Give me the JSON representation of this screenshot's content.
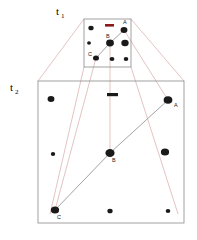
{
  "figure": {
    "background": "#ffffff",
    "frame_color": "#8a8a8a",
    "projection_color": "#d9a9a9",
    "trajectory_color": "#8c8c8c",
    "dot_color": "#1a1a1a",
    "accent_dash_color": "#8c1a1a",
    "dash_color": "#1a1a1a"
  },
  "time_labels": {
    "t1": {
      "base": "t",
      "sub": "1"
    },
    "t2": {
      "base": "t",
      "sub": "2"
    }
  },
  "frame_t1": {
    "x": 84,
    "y": 19,
    "w": 47,
    "h": 48,
    "point_labels": {
      "a": "A",
      "b": "B",
      "c": "C"
    },
    "dots": [
      {
        "cx": 91,
        "cy": 28,
        "r": 2.3
      },
      {
        "cx": 124,
        "cy": 30,
        "r": 3.0
      },
      {
        "cx": 89,
        "cy": 43,
        "r": 1.7
      },
      {
        "cx": 110,
        "cy": 43,
        "r": 3.4
      },
      {
        "cx": 125,
        "cy": 43,
        "r": 3.2
      },
      {
        "cx": 96,
        "cy": 58,
        "r": 2.6
      },
      {
        "cx": 112,
        "cy": 59,
        "r": 2.1
      },
      {
        "cx": 126,
        "cy": 59,
        "r": 2.0
      }
    ],
    "accent_dash": {
      "x": 105,
      "y": 24,
      "w": 9,
      "h": 2.6
    },
    "label_positions": {
      "a": {
        "x": 123,
        "y": 24
      },
      "b": {
        "x": 106,
        "y": 38
      },
      "c": {
        "x": 88,
        "y": 56
      }
    }
  },
  "frame_t2": {
    "x": 38,
    "y": 81,
    "w": 146,
    "h": 142,
    "point_labels": {
      "a": "A",
      "b": "B",
      "c": "C"
    },
    "dots": [
      {
        "cx": 51,
        "cy": 99,
        "r": 3.0
      },
      {
        "cx": 168,
        "cy": 100,
        "r": 3.8
      },
      {
        "cx": 53,
        "cy": 154,
        "r": 1.9
      },
      {
        "cx": 110,
        "cy": 153,
        "r": 4.0
      },
      {
        "cx": 165,
        "cy": 152,
        "r": 3.6
      },
      {
        "cx": 55,
        "cy": 210,
        "r": 3.6
      },
      {
        "cx": 110,
        "cy": 211,
        "r": 2.3
      },
      {
        "cx": 168,
        "cy": 211,
        "r": 2.0
      }
    ],
    "dash": {
      "x": 107,
      "y": 93,
      "w": 11,
      "h": 3.2
    },
    "label_positions": {
      "a": {
        "x": 174,
        "y": 107
      },
      "b": {
        "x": 112,
        "y": 162
      },
      "c": {
        "x": 57,
        "y": 219
      }
    }
  },
  "projection_lines": [
    {
      "x1": 84,
      "y1": 19,
      "x2": 38,
      "y2": 81
    },
    {
      "x1": 131,
      "y1": 19,
      "x2": 184,
      "y2": 81
    },
    {
      "x1": 84,
      "y1": 67,
      "x2": 50,
      "y2": 214
    },
    {
      "x1": 96,
      "y1": 58,
      "x2": 55,
      "y2": 210
    },
    {
      "x1": 110,
      "y1": 43,
      "x2": 110,
      "y2": 153
    },
    {
      "x1": 124,
      "y1": 30,
      "x2": 168,
      "y2": 100
    },
    {
      "x1": 131,
      "y1": 67,
      "x2": 178,
      "y2": 214
    }
  ],
  "trajectories_t1": [
    {
      "x1": 124,
      "y1": 30,
      "x2": 110,
      "y2": 43
    },
    {
      "x1": 110,
      "y1": 43,
      "x2": 96,
      "y2": 58
    }
  ],
  "trajectories_t2": [
    {
      "x1": 168,
      "y1": 100,
      "x2": 110,
      "y2": 153
    },
    {
      "x1": 110,
      "y1": 153,
      "x2": 55,
      "y2": 210
    }
  ],
  "time_label_positions": {
    "t1": {
      "x": 56,
      "y": 15
    },
    "t2": {
      "x": 10,
      "y": 91
    }
  }
}
